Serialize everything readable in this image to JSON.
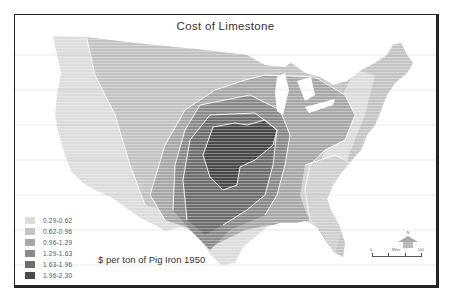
{
  "title": "Cost of Limestone",
  "caption": "$ per ton of Pig Iron 1950",
  "legend": {
    "items": [
      {
        "label": "0.29-0.62",
        "color": "#dcdcdc"
      },
      {
        "label": "0.62-0.96",
        "color": "#c4c4c4"
      },
      {
        "label": "0.96-1.29",
        "color": "#a8a8a8"
      },
      {
        "label": "1.29-1.63",
        "color": "#8a8a8a"
      },
      {
        "label": "1.63-1.96",
        "color": "#6e6e6e"
      },
      {
        "label": "1.96-2.30",
        "color": "#4a4a4a"
      }
    ]
  },
  "scale": {
    "start": "0",
    "mid": "Miles",
    "end": "500"
  },
  "compass": {
    "label": "N"
  }
}
